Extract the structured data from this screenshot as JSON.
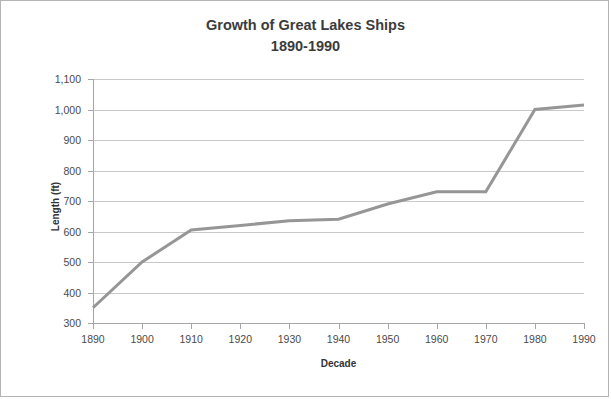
{
  "chart_data": {
    "type": "line",
    "title": "Growth of Great Lakes Ships",
    "subtitle": "1890-1990",
    "xlabel": "Decade",
    "ylabel": "Length (ft)",
    "x": [
      1890,
      1900,
      1910,
      1920,
      1930,
      1940,
      1950,
      1960,
      1970,
      1980,
      1990
    ],
    "series": [
      {
        "name": "Ship length",
        "values": [
          350,
          500,
          605,
          620,
          635,
          640,
          690,
          730,
          730,
          1000,
          1015
        ]
      }
    ],
    "xtick_labels": [
      "1890",
      "1900",
      "1910",
      "1920",
      "1930",
      "1940",
      "1950",
      "1960",
      "1970",
      "1980",
      "1990"
    ],
    "ytick_labels": [
      "300",
      "400",
      "500",
      "600",
      "700",
      "800",
      "900",
      "1,000",
      "1,100"
    ],
    "ytick_values": [
      300,
      400,
      500,
      600,
      700,
      800,
      900,
      1000,
      1100
    ],
    "ylim": [
      300,
      1100
    ],
    "xlim": [
      1890,
      1990
    ],
    "grid": "horizontal",
    "legend": "none",
    "colors": {
      "line": "#969696",
      "gridline": "#c9c9c9",
      "axis": "#a6a6a6",
      "title_text": "#3b3b3b",
      "tick_text": "#4a4a4a",
      "axis_title_text": "#333333",
      "frame_border": "#b4b4b4",
      "background": "#ffffff"
    },
    "line_width_px": 3
  }
}
